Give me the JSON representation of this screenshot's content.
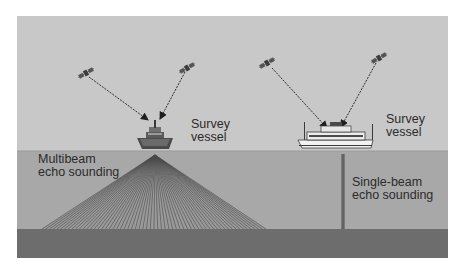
{
  "diagram": {
    "colors": {
      "sky": "#c8c8c8",
      "water": "#a8a8a8",
      "seabed": "#6d6d6d",
      "beam": "#4a4a4a",
      "text": "#2b2b2b"
    },
    "labels": {
      "left_vessel_line1": "Survey",
      "left_vessel_line2": "vessel",
      "right_vessel_line1": "Survey",
      "right_vessel_line2": "vessel",
      "multibeam_line1": "Multibeam",
      "multibeam_line2": "echo sounding",
      "singlebeam_line1": "Single-beam",
      "singlebeam_line2": "echo sounding"
    },
    "satellites": [
      {
        "name": "satellite-1",
        "icon": "satellite-icon"
      },
      {
        "name": "satellite-2",
        "icon": "satellite-icon"
      },
      {
        "name": "satellite-3",
        "icon": "satellite-icon"
      },
      {
        "name": "satellite-4",
        "icon": "satellite-icon"
      }
    ],
    "vessels": [
      {
        "name": "multibeam-survey-vessel",
        "icon": "ship-icon",
        "method": "multibeam"
      },
      {
        "name": "singlebeam-survey-vessel",
        "icon": "ship-icon",
        "method": "single-beam"
      }
    ],
    "multibeam_fan_beams": 60
  }
}
